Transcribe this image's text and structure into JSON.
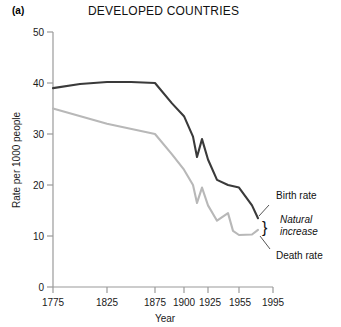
{
  "panel": {
    "label": "(a)"
  },
  "chart_data": {
    "type": "line",
    "title": "DEVELOPED COUNTRIES",
    "xlabel": "Year",
    "ylabel": "Rate per 1000 people",
    "xtick_labels": [
      "1775",
      "1825",
      "1875",
      "1900",
      "1925",
      "1955",
      "1995"
    ],
    "xtick_values": [
      1775,
      1825,
      1875,
      1900,
      1925,
      1955,
      1995
    ],
    "xtick_positions": [
      53,
      107,
      155,
      184,
      208,
      239,
      273
    ],
    "ytick_labels": [
      "0",
      "10",
      "20",
      "30",
      "40",
      "50"
    ],
    "ytick_values": [
      0,
      10,
      20,
      30,
      40,
      50
    ],
    "ylim": [
      0,
      50
    ],
    "grid": false,
    "legend": "annotations",
    "axis_note": "x axis is non-linear: compressed after 1875",
    "series": [
      {
        "name": "Birth rate",
        "color": "#3a3a3a",
        "points": [
          {
            "year": 1775,
            "x": 53,
            "value": 39.0
          },
          {
            "year": 1800,
            "x": 80,
            "value": 39.8
          },
          {
            "year": 1825,
            "x": 107,
            "value": 40.2
          },
          {
            "year": 1850,
            "x": 131,
            "value": 40.2
          },
          {
            "year": 1875,
            "x": 155,
            "value": 40.0
          },
          {
            "year": 1890,
            "x": 172,
            "value": 36.0
          },
          {
            "year": 1900,
            "x": 184,
            "value": 33.5
          },
          {
            "year": 1910,
            "x": 193,
            "value": 29.5
          },
          {
            "year": 1915,
            "x": 197,
            "value": 25.5
          },
          {
            "year": 1920,
            "x": 202,
            "value": 29.0
          },
          {
            "year": 1925,
            "x": 208,
            "value": 25.0
          },
          {
            "year": 1935,
            "x": 217,
            "value": 21.0
          },
          {
            "year": 1945,
            "x": 228,
            "value": 20.0
          },
          {
            "year": 1955,
            "x": 239,
            "value": 19.5
          },
          {
            "year": 1975,
            "x": 252,
            "value": 16.0
          },
          {
            "year": 1995,
            "x": 258,
            "value": 13.5
          }
        ]
      },
      {
        "name": "Death rate",
        "color": "#b8b8b8",
        "points": [
          {
            "year": 1775,
            "x": 53,
            "value": 35.0
          },
          {
            "year": 1825,
            "x": 107,
            "value": 32.0
          },
          {
            "year": 1875,
            "x": 155,
            "value": 30.0
          },
          {
            "year": 1890,
            "x": 172,
            "value": 26.0
          },
          {
            "year": 1900,
            "x": 184,
            "value": 23.0
          },
          {
            "year": 1910,
            "x": 193,
            "value": 20.0
          },
          {
            "year": 1915,
            "x": 197,
            "value": 16.5
          },
          {
            "year": 1920,
            "x": 202,
            "value": 19.5
          },
          {
            "year": 1925,
            "x": 208,
            "value": 16.0
          },
          {
            "year": 1935,
            "x": 217,
            "value": 13.0
          },
          {
            "year": 1945,
            "x": 228,
            "value": 14.5
          },
          {
            "year": 1950,
            "x": 233,
            "value": 11.0
          },
          {
            "year": 1955,
            "x": 239,
            "value": 10.2
          },
          {
            "year": 1975,
            "x": 252,
            "value": 10.3
          },
          {
            "year": 1995,
            "x": 258,
            "value": 11.2
          }
        ]
      }
    ],
    "annotations": [
      {
        "text": "Birth rate",
        "kind": "plain"
      },
      {
        "text": "Natural",
        "kind": "italic"
      },
      {
        "text": "increase",
        "kind": "italic"
      },
      {
        "text": "Death rate",
        "kind": "plain"
      },
      {
        "text": "}",
        "kind": "brace"
      }
    ]
  }
}
